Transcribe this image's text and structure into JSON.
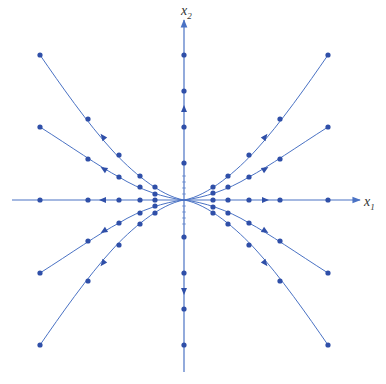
{
  "diagram": {
    "type": "phase-portrait",
    "colors": {
      "line": "#4a72c4",
      "dot": "#2f4fa8",
      "axis": "#4a72c4",
      "text": "#333333"
    },
    "origin_px": [
      184,
      200
    ],
    "axes": {
      "x": {
        "label": "x",
        "subscript": "1",
        "from": [
          12,
          200
        ],
        "to": [
          360,
          200
        ]
      },
      "y": {
        "label": "x",
        "subscript": "2",
        "from": [
          184,
          372
        ],
        "to": [
          184,
          20
        ]
      }
    },
    "trajectories": [
      {
        "name": "upper-left-steep",
        "path": "M184,200 C160,196 130,170 112,150 C88,124 60,84 40,55",
        "dots": [
          [
            155,
            187
          ],
          [
            140,
            176
          ],
          [
            119,
            155
          ],
          [
            88,
            119
          ],
          [
            40,
            55
          ]
        ],
        "arrow": [
          103,
          137,
          -128
        ]
      },
      {
        "name": "upper-left-shallow",
        "path": "M184,200 C165,198 140,190 119,177 C100,167 70,146 40,127",
        "dots": [
          [
            155,
            194
          ],
          [
            140,
            187
          ],
          [
            119,
            177
          ],
          [
            88,
            159
          ],
          [
            40,
            127
          ]
        ],
        "arrow": [
          104,
          169,
          -148
        ]
      },
      {
        "name": "lower-left-shallow",
        "path": "M184,200 C165,202 140,210 119,223 C100,233 70,254 40,273",
        "dots": [
          [
            155,
            206
          ],
          [
            140,
            213
          ],
          [
            119,
            223
          ],
          [
            88,
            241
          ],
          [
            40,
            273
          ]
        ],
        "arrow": [
          104,
          231,
          148
        ]
      },
      {
        "name": "lower-left-steep",
        "path": "M184,200 C160,204 130,230 112,250 C88,276 60,316 40,345",
        "dots": [
          [
            155,
            213
          ],
          [
            140,
            224
          ],
          [
            119,
            245
          ],
          [
            88,
            281
          ],
          [
            40,
            345
          ]
        ],
        "arrow": [
          103,
          263,
          128
        ]
      },
      {
        "name": "upper-right-steep",
        "path": "M184,200 C208,196 238,170 256,150 C280,124 308,84 328,55",
        "dots": [
          [
            213,
            187
          ],
          [
            228,
            176
          ],
          [
            249,
            155
          ],
          [
            280,
            119
          ],
          [
            328,
            55
          ]
        ],
        "arrow": [
          265,
          137,
          -52
        ]
      },
      {
        "name": "upper-right-shallow",
        "path": "M184,200 C203,198 228,190 249,177 C268,167 298,146 328,127",
        "dots": [
          [
            213,
            193
          ],
          [
            228,
            187
          ],
          [
            249,
            177
          ],
          [
            280,
            159
          ],
          [
            328,
            127
          ]
        ],
        "arrow": [
          265,
          169,
          -32
        ]
      },
      {
        "name": "lower-right-shallow",
        "path": "M184,200 C203,202 228,210 249,223 C268,233 298,254 328,273",
        "dots": [
          [
            213,
            207
          ],
          [
            228,
            213
          ],
          [
            249,
            223
          ],
          [
            280,
            241
          ],
          [
            328,
            273
          ]
        ],
        "arrow": [
          265,
          231,
          32
        ]
      },
      {
        "name": "lower-right-steep",
        "path": "M184,200 C208,204 238,230 256,250 C280,276 308,316 328,345",
        "dots": [
          [
            213,
            213
          ],
          [
            228,
            224
          ],
          [
            249,
            245
          ],
          [
            280,
            281
          ],
          [
            328,
            345
          ]
        ],
        "arrow": [
          265,
          263,
          52
        ]
      }
    ],
    "axis_trajectories": {
      "x_negative": {
        "dots": [
          [
            40,
            200
          ],
          [
            88,
            200
          ],
          [
            119,
            200
          ],
          [
            140,
            200
          ],
          [
            155,
            200
          ]
        ],
        "arrow": [
          103,
          200,
          180
        ]
      },
      "x_positive": {
        "dots": [
          [
            213,
            200
          ],
          [
            228,
            200
          ],
          [
            249,
            200
          ],
          [
            280,
            200
          ],
          [
            328,
            200
          ]
        ],
        "arrow": [
          265,
          200,
          0
        ]
      },
      "y_positive": {
        "dots": [
          [
            184,
            55
          ],
          [
            184,
            91
          ],
          [
            184,
            127
          ],
          [
            184,
            163
          ]
        ],
        "arrow": [
          184,
          109,
          -90
        ]
      },
      "y_negative": {
        "dots": [
          [
            184,
            237
          ],
          [
            184,
            273
          ],
          [
            184,
            309
          ],
          [
            184,
            345
          ]
        ],
        "arrow": [
          184,
          291,
          90
        ]
      }
    }
  }
}
